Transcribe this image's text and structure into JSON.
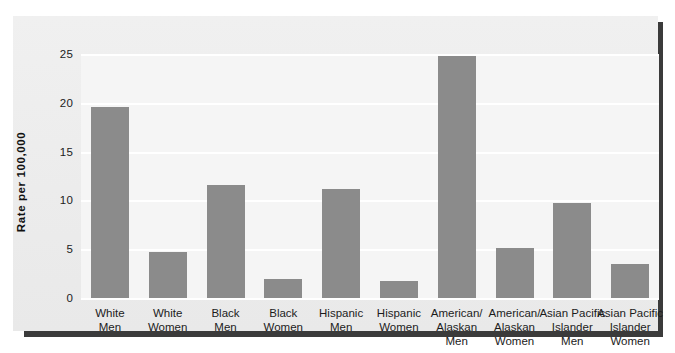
{
  "chart_data": {
    "type": "bar",
    "title": "",
    "subtitle": "",
    "xlabel": "",
    "ylabel": "Rate per 100,000",
    "ylim": [
      0,
      25
    ],
    "yticks": [
      0,
      5,
      10,
      15,
      20,
      25
    ],
    "ytick_labels": [
      "0",
      "5",
      "10",
      "15",
      "20",
      "25"
    ],
    "grid": true,
    "gridline_color": "#ffffff",
    "legend": null,
    "legend_position": "none",
    "bar_color": "#8b8b8b",
    "plot_background": "#f5f5f5",
    "panel_background": "#efefef",
    "frame_color": "#3b3b3b",
    "categories": [
      "White\nMen",
      "White\nWomen",
      "Black\nMen",
      "Black\nWomen",
      "Hispanic\nMen",
      "Hispanic\nWomen",
      "American/\nAlaskan\nMen",
      "American/\nAlaskan\nWomen",
      "Asian Pacific\nIslander\nMen",
      "Asian Pacific\nIslander\nWomen"
    ],
    "values": [
      19.7,
      4.8,
      11.7,
      2.1,
      11.3,
      1.8,
      24.9,
      5.2,
      9.8,
      3.6
    ]
  }
}
